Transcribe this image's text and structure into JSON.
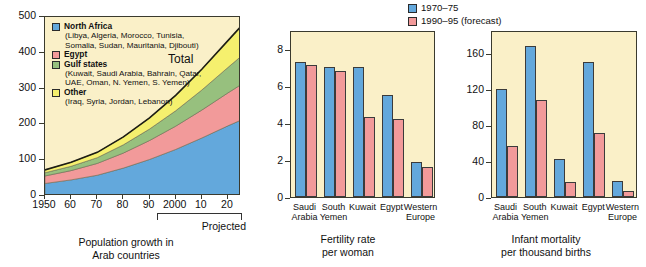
{
  "chart_data": [
    {
      "type": "area",
      "title": "Population growth in Arab countries",
      "caption_line1": "Population growth in",
      "caption_line2": "Arab countries",
      "xlabel": "",
      "ylabel": "",
      "ylim": [
        0,
        500
      ],
      "yticks": [
        0,
        100,
        200,
        300,
        400,
        500
      ],
      "xlim": [
        1950,
        2025
      ],
      "xticks": [
        1950,
        1960,
        1970,
        1980,
        1990,
        2000,
        2010,
        2020
      ],
      "xticklabels": [
        "1950",
        "60",
        "70",
        "80",
        "90",
        "2000",
        "10",
        "20"
      ],
      "projected_label": "Projected",
      "projected_from": 1995,
      "total_label": "Total",
      "stacked": true,
      "x": [
        1950,
        1960,
        1970,
        1980,
        1990,
        2000,
        2010,
        2020,
        2025
      ],
      "series": [
        {
          "name": "North Africa",
          "color": "#63a8dc",
          "detail": "(Libya, Algeria, Morocco, Tunisia, Somalia, Sudan, Mauritania, Djibouti)",
          "values": [
            35,
            45,
            58,
            78,
            102,
            130,
            162,
            196,
            212
          ]
        },
        {
          "name": "Egypt",
          "color": "#f29a9a",
          "detail": "",
          "values": [
            21,
            26,
            33,
            42,
            53,
            65,
            78,
            92,
            99
          ]
        },
        {
          "name": "Gulf states",
          "color": "#97c07e",
          "detail": "(Kuwait, Saudi Arabia, Bahrain, Qatar, UAE, Oman, N. Yemen, S. Yemen)",
          "values": [
            9,
            12,
            16,
            23,
            32,
            43,
            56,
            71,
            79
          ]
        },
        {
          "name": "Other",
          "color": "#f5f06e",
          "detail": "(Iraq, Syria, Jordan, Lebanon)",
          "values": [
            8,
            11,
            15,
            22,
            31,
            43,
            58,
            75,
            84
          ]
        }
      ],
      "totals": [
        73,
        94,
        122,
        165,
        218,
        281,
        354,
        434,
        474
      ]
    },
    {
      "type": "bar",
      "title": "Fertility rate per woman",
      "caption_line1": "Fertility rate",
      "caption_line2": "per woman",
      "xlabel": "",
      "ylabel": "",
      "ylim": [
        0,
        9
      ],
      "yticks": [
        0,
        2,
        4,
        6,
        8
      ],
      "categories": [
        "Saudi Arabia",
        "South Yemen",
        "Kuwait",
        "Egypt",
        "Western Europe"
      ],
      "category_lines": [
        [
          "Saudi",
          "Arabia"
        ],
        [
          "South",
          "Yemen"
        ],
        [
          "Kuwait",
          ""
        ],
        [
          "Egypt",
          ""
        ],
        [
          "Western",
          "Europe"
        ]
      ],
      "series": [
        {
          "name": "1970–75",
          "color": "#63a8dc",
          "values": [
            7.3,
            7.0,
            7.0,
            5.5,
            1.9
          ]
        },
        {
          "name": "1990–95 (forecast)",
          "color": "#f29a9a",
          "values": [
            7.1,
            6.8,
            4.3,
            4.2,
            1.6
          ]
        }
      ]
    },
    {
      "type": "bar",
      "title": "Infant mortality per thousand births",
      "caption_line1": "Infant mortality",
      "caption_line2": "per thousand births",
      "xlabel": "",
      "ylabel": "",
      "ylim": [
        0,
        185
      ],
      "yticks": [
        0,
        40,
        80,
        120,
        160
      ],
      "categories": [
        "Saudi Arabia",
        "South Yemen",
        "Kuwait",
        "Egypt",
        "Western Europe"
      ],
      "category_lines": [
        [
          "Saudi",
          "Arabia"
        ],
        [
          "South",
          "Yemen"
        ],
        [
          "Kuwait",
          ""
        ],
        [
          "Egypt",
          ""
        ],
        [
          "Western",
          "Europe"
        ]
      ],
      "series": [
        {
          "name": "1970–75",
          "color": "#63a8dc",
          "values": [
            120,
            167,
            42,
            150,
            18
          ]
        },
        {
          "name": "1990–95 (forecast)",
          "color": "#f29a9a",
          "values": [
            57,
            107,
            17,
            71,
            7
          ]
        }
      ]
    }
  ],
  "bars_legend": {
    "items": [
      {
        "label": "1970–75",
        "color": "#63a8dc"
      },
      {
        "label": "1990–95 (forecast)",
        "color": "#f29a9a"
      }
    ]
  },
  "colors": {
    "plot_background": "#faf0c8",
    "axis": "#3a3a2e",
    "north_africa": "#63a8dc",
    "egypt": "#f29a9a",
    "gulf_states": "#97c07e",
    "other": "#f5f06e",
    "bar_blue": "#63a8dc",
    "bar_red": "#f29a9a",
    "page_background": "#ffffff"
  }
}
